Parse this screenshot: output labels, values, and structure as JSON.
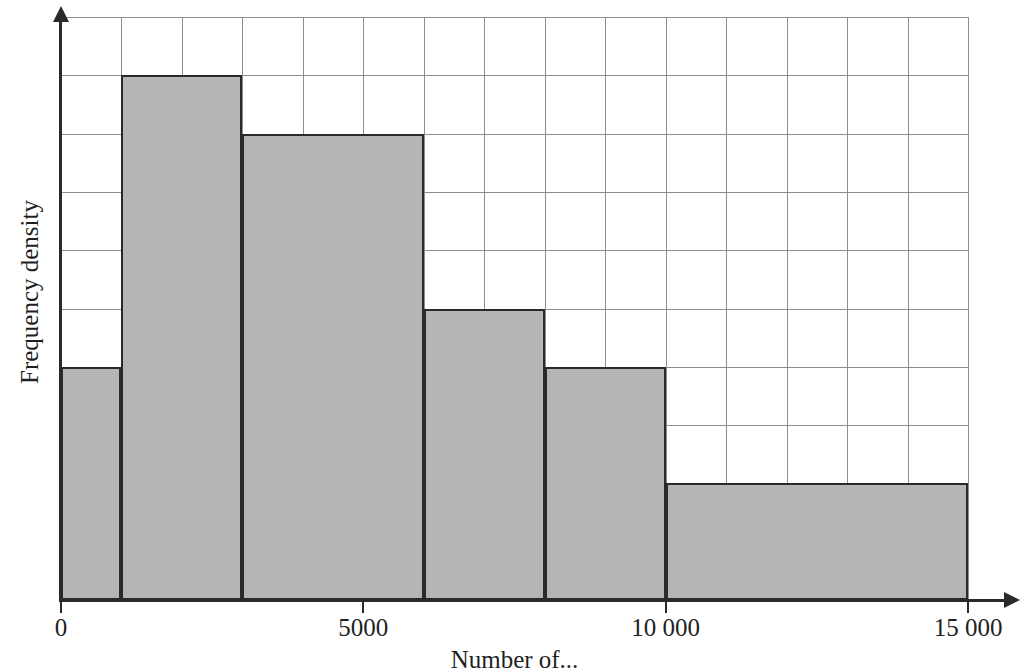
{
  "chart_data": {
    "type": "bar",
    "title": "",
    "subtitle": "",
    "xlabel": "Number of...",
    "ylabel": "Frequency density",
    "grid": true,
    "legend": null,
    "legend_position": "none",
    "xlim": [
      0,
      15000
    ],
    "ylim": [
      0,
      10
    ],
    "x_tick_labels": [
      "0",
      "5000",
      "10 000",
      "15 000"
    ],
    "x_tick_values": [
      0,
      5000,
      10000,
      15000
    ],
    "y_tick_labels": [],
    "x_gridline_step": 1000,
    "y_gridline_count": 10,
    "bar_fill_color": "#b5b5b5",
    "bar_edge_color": "#2a2a2a",
    "gridline_color": "#8e8e8e",
    "axis_color": "#2a2a2a",
    "bins": [
      {
        "label": "0-1000",
        "x_start": 0,
        "x_end": 1000,
        "frequency_density": 4
      },
      {
        "label": "1000-3000",
        "x_start": 1000,
        "x_end": 3000,
        "frequency_density": 9
      },
      {
        "label": "3000-6000",
        "x_start": 3000,
        "x_end": 6000,
        "frequency_density": 8
      },
      {
        "label": "6000-8000",
        "x_start": 6000,
        "x_end": 8000,
        "frequency_density": 5
      },
      {
        "label": "8000-10000",
        "x_start": 8000,
        "x_end": 10000,
        "frequency_density": 4
      },
      {
        "label": "10000-15000",
        "x_start": 10000,
        "x_end": 15000,
        "frequency_density": 2
      }
    ],
    "categories": [
      "0-1000",
      "1000-3000",
      "3000-6000",
      "6000-8000",
      "8000-10000",
      "10000-15000"
    ],
    "values": [
      4,
      9,
      8,
      5,
      4,
      2
    ]
  },
  "axes": {
    "y_title": "Frequency density",
    "x_title": "Number of..."
  }
}
